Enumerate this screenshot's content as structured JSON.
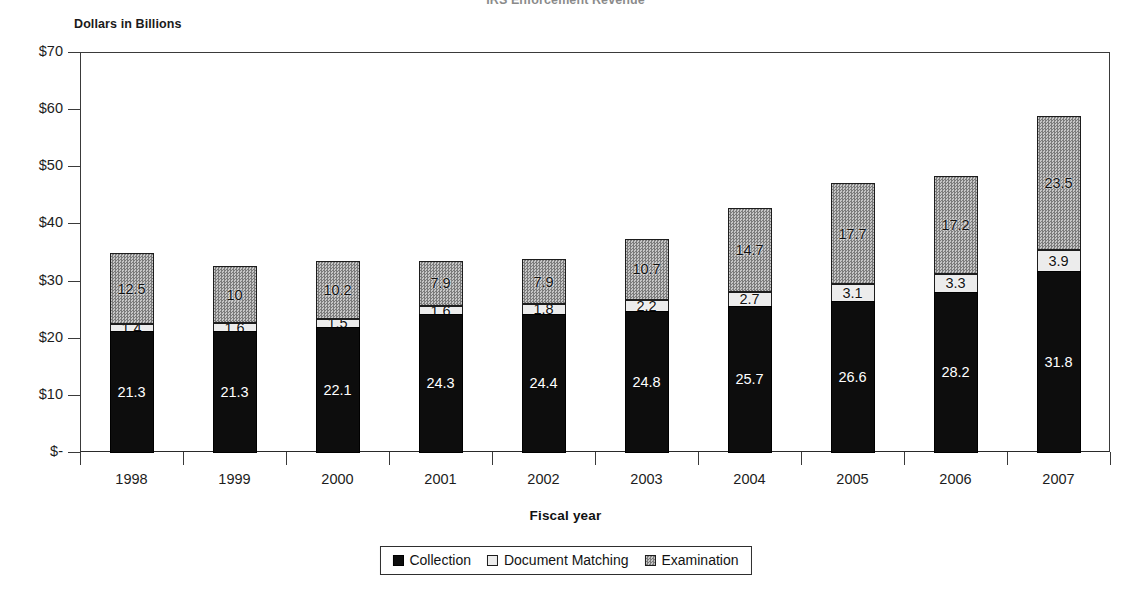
{
  "chart_data": {
    "type": "bar",
    "subtype": "stacked-bar",
    "title": "IRS Enforcement Revenue",
    "y_axis_caption": "Dollars in Billions",
    "xlabel": "Fiscal year",
    "ylabel": "",
    "categories": [
      "1998",
      "1999",
      "2000",
      "2001",
      "2002",
      "2003",
      "2004",
      "2005",
      "2006",
      "2007"
    ],
    "series": [
      {
        "name": "Collection",
        "color": "#0d0d0d",
        "values": [
          21.3,
          21.3,
          22.1,
          24.3,
          24.4,
          24.8,
          25.7,
          26.6,
          28.2,
          31.8
        ],
        "labels": [
          "21.3",
          "21.3",
          "22.1",
          "24.3",
          "24.4",
          "24.8",
          "25.7",
          "26.6",
          "28.2",
          "31.8"
        ]
      },
      {
        "name": "Document Matching",
        "color": "#ececec",
        "values": [
          1.4,
          1.6,
          1.5,
          1.6,
          1.8,
          2.2,
          2.7,
          3.1,
          3.3,
          3.9
        ],
        "labels": [
          "1.4",
          "1.6",
          "1.5",
          "1.6",
          "1.8",
          "2.2",
          "2.7",
          "3.1",
          "3.3",
          "3.9"
        ]
      },
      {
        "name": "Examination",
        "color": "#a8a8a8",
        "values": [
          12.5,
          10,
          10.2,
          7.9,
          7.9,
          10.7,
          14.7,
          17.7,
          17.2,
          23.5
        ],
        "labels": [
          "12.5",
          "10",
          "10.2",
          "7.9",
          "7.9",
          "10.7",
          "14.7",
          "17.7",
          "17.2",
          "23.5"
        ]
      }
    ],
    "ylim": [
      0,
      70
    ],
    "y_ticks": [
      0,
      10,
      20,
      30,
      40,
      50,
      60,
      70
    ],
    "y_tick_labels": [
      "$-",
      "$10",
      "$20",
      "$30",
      "$40",
      "$50",
      "$60",
      "$70"
    ],
    "grid": false,
    "legend_position": "bottom",
    "legend": [
      "Collection",
      "Document Matching",
      "Examination"
    ]
  }
}
